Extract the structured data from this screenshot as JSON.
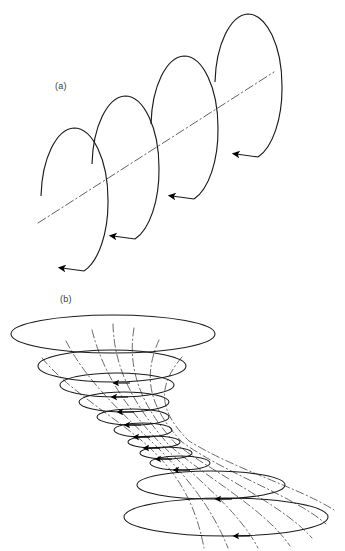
{
  "figure": {
    "type": "scientific-line-diagram",
    "background_color": "#ffffff",
    "stroke_color": "#1a1a1a",
    "dash_dot_color": "#555555",
    "width": 345,
    "height": 551
  },
  "panels": [
    {
      "id": "panel-a",
      "label": "(a)",
      "label_x": 55,
      "label_y": 81,
      "description": "Four tilted open circular loops threaded by an inclined dash-dot axis, each loop carrying a solid arrowhead indicating circulation direction.",
      "axis": {
        "x1": 38,
        "y1": 223,
        "x2": 274,
        "y2": 72,
        "style": "dash-dot"
      },
      "loops": [
        {
          "cx": 74,
          "cy": 200,
          "rx": 34,
          "ry": 72,
          "arrow_angle": 108
        },
        {
          "cx": 125,
          "cy": 168,
          "rx": 34,
          "ry": 72,
          "arrow_angle": 108
        },
        {
          "cx": 184,
          "cy": 128,
          "rx": 34,
          "ry": 72,
          "arrow_angle": 108
        },
        {
          "cx": 248,
          "cy": 86,
          "rx": 34,
          "ry": 72,
          "arrow_angle": 108
        }
      ]
    },
    {
      "id": "panel-b",
      "label": "(b)",
      "label_x": 60,
      "label_y": 294,
      "description": "Hourglass-shaped flux tube: a stack of horizontal ellipses narrowing to a waist then flaring again, with dash-dot field lines converging through the constriction and solid arrowheads on each ellipse.",
      "rings": [
        {
          "cx": 113,
          "cy": 334,
          "rx": 102,
          "ry": 19
        },
        {
          "cx": 112,
          "cy": 366,
          "rx": 74,
          "ry": 16
        },
        {
          "cx": 117,
          "cy": 385,
          "rx": 57,
          "ry": 12
        },
        {
          "cx": 124,
          "cy": 402,
          "rx": 45,
          "ry": 10
        },
        {
          "cx": 133,
          "cy": 417,
          "rx": 36,
          "ry": 8
        },
        {
          "cx": 143,
          "cy": 430,
          "rx": 29,
          "ry": 7
        },
        {
          "cx": 154,
          "cy": 442,
          "rx": 26,
          "ry": 6
        },
        {
          "cx": 166,
          "cy": 453,
          "rx": 26,
          "ry": 6
        },
        {
          "cx": 180,
          "cy": 463,
          "rx": 30,
          "ry": 7
        },
        {
          "cx": 211,
          "cy": 485,
          "rx": 74,
          "ry": 14
        },
        {
          "cx": 226,
          "cy": 517,
          "rx": 102,
          "ry": 19
        }
      ],
      "field_lines": 7
    }
  ]
}
